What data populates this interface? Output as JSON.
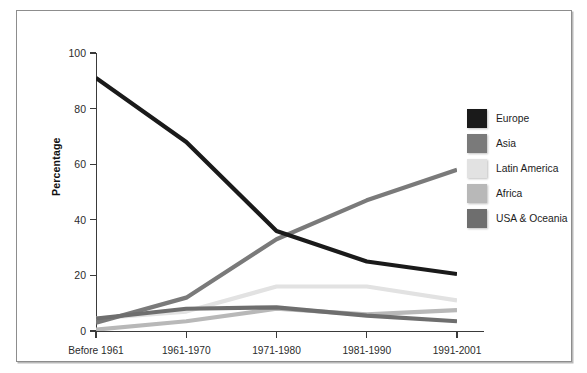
{
  "source_note": "Source: Statistics Canada, 2001 Census.",
  "legend": {
    "items": [
      {
        "label": "Europe",
        "color": "#1a1a1a"
      },
      {
        "label": "Asia",
        "color": "#7a7a7a"
      },
      {
        "label": "Latin America",
        "color": "#e2e2e2"
      },
      {
        "label": "Africa",
        "color": "#b8b8b8"
      },
      {
        "label": "USA & Oceania",
        "color": "#6e6e6e"
      }
    ]
  },
  "axes": {
    "y_ticks": [
      "0",
      "20",
      "40",
      "60",
      "80",
      "100"
    ],
    "y_title": "Percentage",
    "x_ticks": [
      "Before 1961",
      "1961-1970",
      "1971-1980",
      "1981-1990",
      "1991-2001"
    ]
  },
  "chart_data": {
    "type": "line",
    "title": "",
    "xlabel": "",
    "ylabel": "Percentage",
    "ylim": [
      0,
      100
    ],
    "ytick_values": [
      0,
      20,
      40,
      60,
      80,
      100
    ],
    "grid": false,
    "legend_position": "right",
    "categories": [
      "Before 1961",
      "1961-1970",
      "1971-1980",
      "1981-1990",
      "1991-2001"
    ],
    "series": [
      {
        "name": "Europe",
        "color": "#1a1a1a",
        "values": [
          91,
          68,
          36,
          25,
          20.5
        ]
      },
      {
        "name": "Asia",
        "color": "#7a7a7a",
        "values": [
          3,
          12,
          33,
          47,
          58
        ]
      },
      {
        "name": "Latin America",
        "color": "#e2e2e2",
        "values": [
          4.5,
          7,
          16,
          16,
          11
        ]
      },
      {
        "name": "Africa",
        "color": "#b8b8b8",
        "values": [
          0.5,
          3.5,
          8,
          6,
          7.5
        ]
      },
      {
        "name": "USA & Oceania",
        "color": "#6e6e6e",
        "values": [
          4.5,
          8,
          8.5,
          5.5,
          3.5
        ]
      }
    ]
  }
}
